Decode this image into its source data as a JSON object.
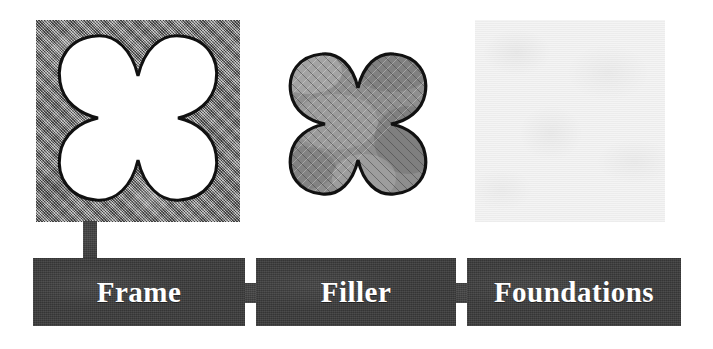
{
  "diagram": {
    "type": "three-stage labelled panel diagram",
    "background_color": "#ffffff",
    "bar_color": "#3b3b3b",
    "bar_text_color": "#ffffff",
    "outline_color": "#111111",
    "texture_mid_gray": "#8e8e8e",
    "texture_pale_gray": "#f4f4f4"
  },
  "panels": [
    {
      "id": "frame",
      "name": "frame-panel",
      "description": "textured gray square with white quatrefoil cut-out",
      "fill": "mid-gray-texture",
      "shape": "quatrefoil-cutout",
      "shape_fill": "#ffffff"
    },
    {
      "id": "filler",
      "name": "filler-panel",
      "description": "free-standing quatrefoil filled with gray texture",
      "fill": "mid-gray-texture",
      "shape": "quatrefoil-solid",
      "shape_fill": "mid-gray-texture"
    },
    {
      "id": "foundations",
      "name": "foundations-panel",
      "description": "plain very pale textured square",
      "fill": "pale-gray-texture",
      "shape": "none",
      "shape_fill": ""
    }
  ],
  "bars": [
    {
      "id": "frame",
      "label": "Frame"
    },
    {
      "id": "filler",
      "label": "Filler"
    },
    {
      "id": "foundations",
      "label": "Foundations"
    }
  ],
  "connectors": [
    {
      "id": "stem-frame",
      "kind": "vertical",
      "from": "frame-panel",
      "to": "frame-bar"
    },
    {
      "id": "tab-1",
      "kind": "horizontal",
      "from": "frame-bar",
      "to": "filler-bar"
    },
    {
      "id": "tab-2",
      "kind": "horizontal",
      "from": "filler-bar",
      "to": "foundations-bar"
    }
  ]
}
